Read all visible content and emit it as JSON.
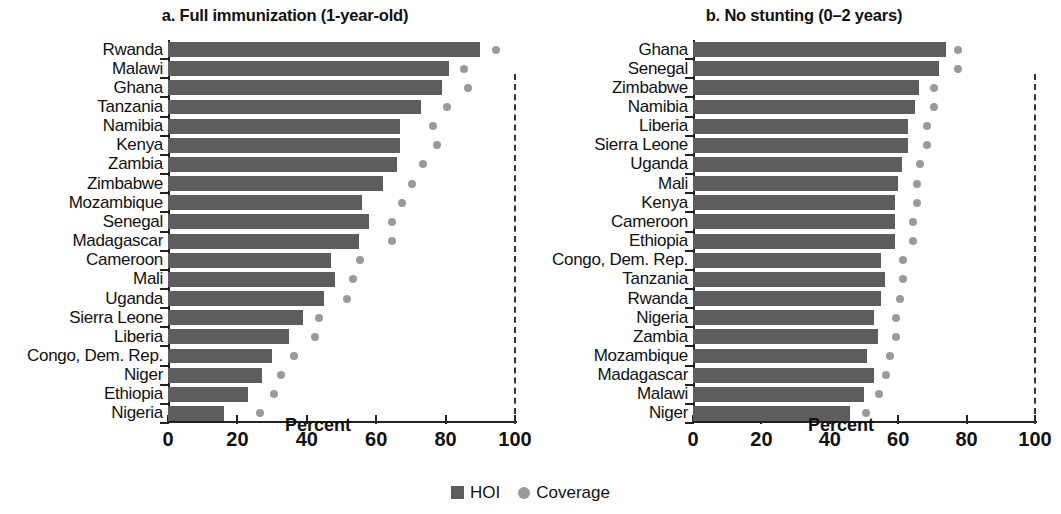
{
  "legend": {
    "items": [
      {
        "key": "hoi",
        "label": "HOI",
        "marker": "square-swatch-icon",
        "color": "#5d5d5d"
      },
      {
        "key": "coverage",
        "label": "Coverage",
        "marker": "circle-swatch-icon",
        "color": "#9a9a9a"
      }
    ]
  },
  "chart_data": [
    {
      "type": "bar",
      "panel": "a",
      "title": "a. Full immunization (1-year-old)",
      "xlabel": "Percent",
      "ylabel": "",
      "xlim": [
        0,
        100
      ],
      "xticks": [
        0,
        20,
        40,
        60,
        80,
        100
      ],
      "xtick_labels": [
        "0",
        "20",
        "40",
        "60",
        "80",
        "100"
      ],
      "grid": false,
      "orientation": "horizontal",
      "reference_line": {
        "value": 100,
        "style": "dashed"
      },
      "legend_position": "bottom-center",
      "categories": [
        "Rwanda",
        "Malawi",
        "Ghana",
        "Tanzania",
        "Namibia",
        "Kenya",
        "Zambia",
        "Zimbabwe",
        "Mozambique",
        "Senegal",
        "Madagascar",
        "Cameroon",
        "Mali",
        "Uganda",
        "Sierra Leone",
        "Liberia",
        "Congo, Dem. Rep.",
        "Niger",
        "Ethiopia",
        "Nigeria"
      ],
      "series": [
        {
          "name": "HOI",
          "color": "#5d5d5d",
          "values": [
            90,
            81,
            79,
            73,
            67,
            67,
            66,
            62,
            56,
            58,
            55,
            47,
            48,
            45,
            39,
            35,
            30,
            27,
            23,
            16
          ]
        },
        {
          "name": "Coverage",
          "color": "#9a9a9a",
          "marker": "circle",
          "values": [
            93,
            84,
            85,
            79,
            75,
            76,
            72,
            69,
            66,
            63,
            63,
            54,
            52,
            50,
            42,
            41,
            35,
            31,
            29,
            25
          ]
        }
      ]
    },
    {
      "type": "bar",
      "panel": "b",
      "title": "b. No stunting (0–2 years)",
      "xlabel": "Percent",
      "ylabel": "",
      "xlim": [
        0,
        100
      ],
      "xticks": [
        0,
        20,
        40,
        60,
        80,
        100
      ],
      "xtick_labels": [
        "0",
        "20",
        "40",
        "60",
        "80",
        "100"
      ],
      "grid": false,
      "orientation": "horizontal",
      "reference_line": {
        "value": 100,
        "style": "dashed"
      },
      "legend_position": "bottom-center",
      "categories": [
        "Ghana",
        "Senegal",
        "Zimbabwe",
        "Namibia",
        "Liberia",
        "Sierra Leone",
        "Uganda",
        "Mali",
        "Kenya",
        "Cameroon",
        "Ethiopia",
        "Congo, Dem. Rep.",
        "Tanzania",
        "Rwanda",
        "Nigeria",
        "Zambia",
        "Mozambique",
        "Madagascar",
        "Malawi",
        "Niger"
      ],
      "series": [
        {
          "name": "HOI",
          "color": "#5d5d5d",
          "values": [
            74,
            72,
            66,
            65,
            63,
            63,
            61,
            60,
            59,
            59,
            59,
            55,
            56,
            55,
            53,
            54,
            51,
            53,
            50,
            46
          ]
        },
        {
          "name": "Coverage",
          "color": "#9a9a9a",
          "marker": "circle",
          "values": [
            76,
            76,
            69,
            69,
            67,
            67,
            65,
            64,
            64,
            63,
            63,
            60,
            60,
            59,
            58,
            58,
            56,
            55,
            53,
            49
          ]
        }
      ]
    }
  ]
}
